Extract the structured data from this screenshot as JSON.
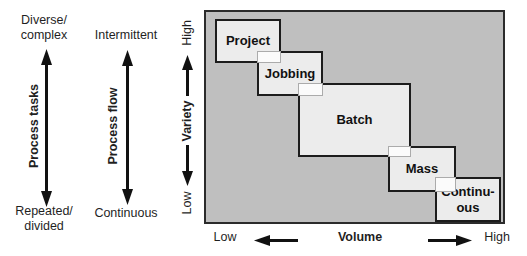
{
  "figure": {
    "left_axes": [
      {
        "top": "Diverse/\ncomplex",
        "label": "Process tasks",
        "bottom": "Repeated/\ndivided"
      },
      {
        "top": "Intermittent",
        "label": "Process flow",
        "bottom": "Continuous"
      }
    ],
    "variety_axis": {
      "high": "High",
      "label": "Variety",
      "low": "Low"
    },
    "volume_axis": {
      "low": "Low",
      "label": "Volume",
      "high": "High"
    },
    "process_types": [
      {
        "label": "Project"
      },
      {
        "label": "Jobbing"
      },
      {
        "label": "Batch"
      },
      {
        "label": "Mass"
      },
      {
        "label": "Continu-\nous"
      }
    ],
    "colors": {
      "chart_background": "#bfbfbf",
      "box_fill": "#ececec",
      "overlap_fill": "#fbfbfb",
      "line": "#111111"
    }
  }
}
